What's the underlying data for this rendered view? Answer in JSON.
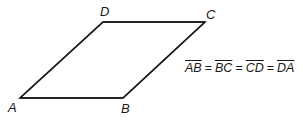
{
  "diagram": {
    "shape": "rhombus",
    "vertices": [
      {
        "label": "A"
      },
      {
        "label": "B"
      },
      {
        "label": "C"
      },
      {
        "label": "D"
      }
    ],
    "equation": {
      "segments": [
        "AB",
        "BC",
        "CD",
        "DA"
      ],
      "operator": "="
    },
    "stroke_color": "#1a1a1a"
  }
}
